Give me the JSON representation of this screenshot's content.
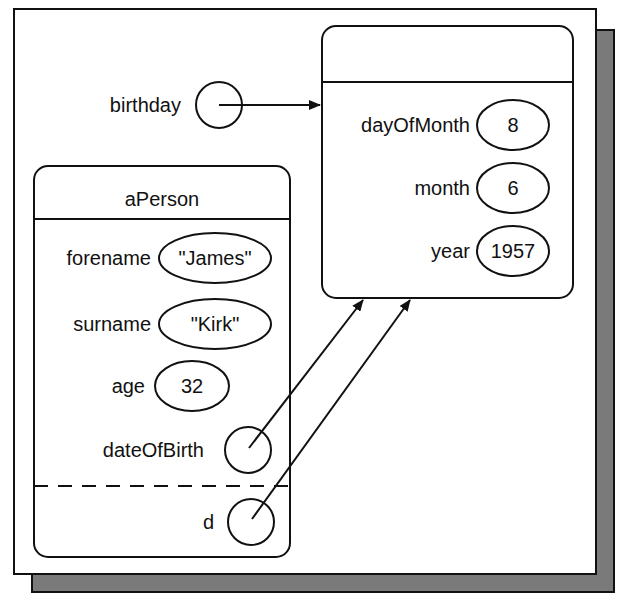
{
  "diagram": {
    "type": "object-reference diagram",
    "colors": {
      "line": "#111111",
      "background": "#ffffff",
      "shadow": "#7a7a7a"
    },
    "birthday": {
      "label": "birthday",
      "points_to": "date_object"
    },
    "date_object": {
      "title": "",
      "fields": [
        {
          "name": "dayOfMonth",
          "value": "8"
        },
        {
          "name": "month",
          "value": "6"
        },
        {
          "name": "year",
          "value": "1957"
        }
      ]
    },
    "person_object": {
      "title": "aPerson",
      "fields": [
        {
          "name": "forename",
          "value": "\"James\""
        },
        {
          "name": "surname",
          "value": "\"Kirk\""
        },
        {
          "name": "age",
          "value": "32"
        }
      ],
      "references": [
        {
          "name": "dateOfBirth",
          "points_to": "date_object"
        }
      ],
      "local_references": [
        {
          "name": "d",
          "points_to": "date_object"
        }
      ]
    }
  }
}
